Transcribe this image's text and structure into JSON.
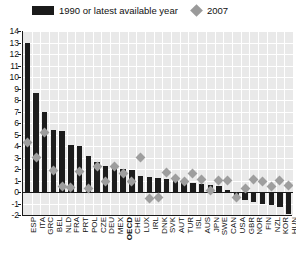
{
  "legend": {
    "series": [
      {
        "label": "1990 or latest available year",
        "marker": "bar-swatch",
        "color": "#1a1a1a"
      },
      {
        "label": "2007",
        "marker": "diamond-swatch",
        "color": "#9a9a9a"
      }
    ]
  },
  "chart_data": {
    "type": "bar",
    "title": "",
    "subtitle": "",
    "xlabel": "",
    "ylabel": "",
    "ylim": [
      -2,
      14
    ],
    "yticks": [
      14,
      13,
      12,
      11,
      10,
      9,
      8,
      7,
      6,
      5,
      4,
      3,
      2,
      1,
      0,
      -1,
      -2
    ],
    "ytick_labels": [
      "14",
      "13",
      "12",
      "11",
      "10",
      "9",
      "8",
      "7",
      "6",
      "5",
      "4",
      "3",
      "2",
      "1",
      "0",
      "-1",
      "-2"
    ],
    "grid": true,
    "legend_position": "top",
    "highlight_category": "OECD",
    "categories": [
      "ESP",
      "ITA",
      "GRC",
      "BEL",
      "NLD",
      "FRA",
      "PRT",
      "POL",
      "CZE",
      "DEU",
      "MEX",
      "OECD",
      "CHE",
      "LUX",
      "IRL",
      "DNK",
      "SVK",
      "AUT",
      "TUR",
      "ISL",
      "AUS",
      "JPN",
      "SWE",
      "CAN",
      "USA",
      "GBR",
      "NOR",
      "FIN",
      "NZL",
      "KOR",
      "HUN"
    ],
    "series": [
      {
        "name": "1990 or latest available year",
        "type": "bar",
        "color": "#1c1c1c",
        "values": [
          13.0,
          8.6,
          7.0,
          5.4,
          5.3,
          4.1,
          4.0,
          3.1,
          2.6,
          2.3,
          2.2,
          2.0,
          1.9,
          1.4,
          1.3,
          1.2,
          1.1,
          1.0,
          0.9,
          0.8,
          0.7,
          0.6,
          0.5,
          0.2,
          -0.4,
          -0.7,
          -0.9,
          -1.0,
          -1.1,
          -1.3,
          -1.9
        ]
      },
      {
        "name": "2007",
        "type": "scatter",
        "marker": "diamond",
        "color": "#9e9e9e",
        "values": [
          4.3,
          3.0,
          5.2,
          1.9,
          0.5,
          0.4,
          1.8,
          0.3,
          2.2,
          0.9,
          2.2,
          1.6,
          0.9,
          3.0,
          -0.6,
          -0.5,
          1.7,
          1.2,
          0.9,
          1.6,
          1.1,
          0.1,
          1.0,
          1.0,
          -0.5,
          0.3,
          1.1,
          0.9,
          0.5,
          1.0,
          0.6
        ]
      }
    ]
  }
}
